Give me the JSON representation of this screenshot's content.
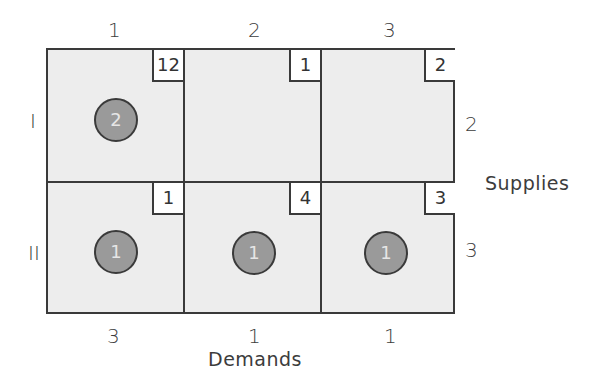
{
  "diagram": {
    "type": "transportation-tableau",
    "columns": [
      "1",
      "2",
      "3"
    ],
    "rows": [
      "I",
      "II"
    ],
    "costs": [
      [
        "12",
        "1",
        "2"
      ],
      [
        "1",
        "4",
        "3"
      ]
    ],
    "allocations": [
      [
        "2",
        null,
        null
      ],
      [
        "1",
        "1",
        "1"
      ]
    ],
    "supplies": [
      "2",
      "3"
    ],
    "demands": [
      "3",
      "1",
      "1"
    ],
    "supplies_label": "Supplies",
    "demands_label": "Demands"
  },
  "colors": {
    "grid_line": "#3a3a3a",
    "cell_fill": "#eeeeee",
    "cost_box_fill": "#ffffff",
    "allocation_fill": "#9a9a9a",
    "allocation_text": "#e6e6e6"
  }
}
